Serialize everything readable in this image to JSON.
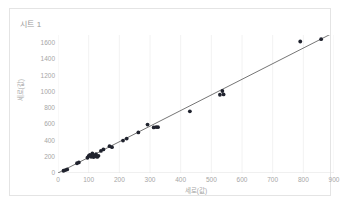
{
  "chart_data": {
    "type": "scatter",
    "title": "시트 1",
    "xlabel": "세로(값)",
    "ylabel": "세로(값)",
    "xlim": [
      0,
      900
    ],
    "ylim": [
      0,
      1700
    ],
    "xticks": [
      0,
      100,
      200,
      300,
      400,
      500,
      600,
      700,
      800,
      900
    ],
    "yticks": [
      0,
      200,
      400,
      600,
      800,
      1000,
      1200,
      1400,
      1600
    ],
    "grid": "vertical-light",
    "legend": "none",
    "marker_color": "#20232e",
    "trendline_color": "#3a3a3a",
    "grid_color": "#f2f2f2",
    "axis_text_color": "#a6a6a6",
    "series": [
      {
        "name": "데이터",
        "points": [
          [
            18,
            28
          ],
          [
            24,
            36
          ],
          [
            30,
            44
          ],
          [
            62,
            120
          ],
          [
            68,
            130
          ],
          [
            96,
            188
          ],
          [
            100,
            210
          ],
          [
            104,
            222
          ],
          [
            108,
            200
          ],
          [
            112,
            240
          ],
          [
            116,
            196
          ],
          [
            118,
            218
          ],
          [
            122,
            206
          ],
          [
            124,
            232
          ],
          [
            128,
            198
          ],
          [
            132,
            212
          ],
          [
            140,
            272
          ],
          [
            148,
            290
          ],
          [
            168,
            330
          ],
          [
            176,
            318
          ],
          [
            212,
            400
          ],
          [
            224,
            424
          ],
          [
            262,
            500
          ],
          [
            292,
            596
          ],
          [
            312,
            562
          ],
          [
            320,
            566
          ],
          [
            326,
            564
          ],
          [
            430,
            760
          ],
          [
            528,
            964
          ],
          [
            536,
            1010
          ],
          [
            540,
            968
          ],
          [
            790,
            1620
          ],
          [
            858,
            1648
          ]
        ]
      }
    ],
    "trendline": {
      "x0": 0,
      "y0": 0,
      "x1": 890,
      "y1": 1712
    }
  }
}
